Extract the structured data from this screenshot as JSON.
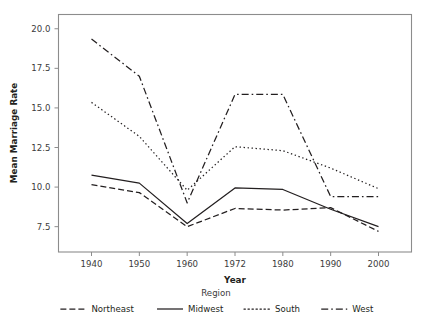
{
  "chart_data": {
    "type": "line",
    "title": "",
    "xlabel": "Year",
    "ylabel": "Mean Marriage Rate",
    "legend_title": "Region",
    "legend_position": "bottom",
    "grid": false,
    "categories": [
      "1940",
      "1950",
      "1960",
      "1972",
      "1980",
      "1990",
      "2000"
    ],
    "x_tick_labels": [
      "1940",
      "1950",
      "1960",
      "1972",
      "1980",
      "1990",
      "2000"
    ],
    "y_tick_labels": [
      "7.5",
      "10.0",
      "12.5",
      "15.0",
      "17.5",
      "20.0"
    ],
    "y_ticks": [
      7.5,
      10.0,
      12.5,
      15.0,
      17.5,
      20.0
    ],
    "ylim": [
      5.9,
      20.9
    ],
    "series": [
      {
        "name": "Northeast",
        "dash": "dashed",
        "values": [
          10.15,
          9.65,
          7.5,
          8.65,
          8.55,
          8.7,
          7.2
        ]
      },
      {
        "name": "Midwest",
        "dash": "solid",
        "values": [
          10.75,
          10.25,
          7.7,
          9.95,
          9.85,
          8.6,
          7.5
        ]
      },
      {
        "name": "South",
        "dash": "dotted",
        "values": [
          15.35,
          13.2,
          9.8,
          12.55,
          12.3,
          11.2,
          9.9
        ]
      },
      {
        "name": "West",
        "dash": "dashdot",
        "values": [
          19.35,
          17.0,
          9.0,
          15.85,
          15.85,
          9.4,
          9.4
        ]
      }
    ]
  },
  "axis": {
    "x_label": "Year",
    "y_label": "Mean Marriage Rate"
  },
  "legend": {
    "title": "Region",
    "items": [
      {
        "label": "Northeast",
        "style": "dashed"
      },
      {
        "label": "Midwest",
        "style": "solid"
      },
      {
        "label": "South",
        "style": "dotted"
      },
      {
        "label": "West",
        "style": "dashdot"
      }
    ]
  },
  "colors": {
    "ink": "#231f20",
    "axis": "#8c8c8c",
    "background": "#ffffff"
  }
}
